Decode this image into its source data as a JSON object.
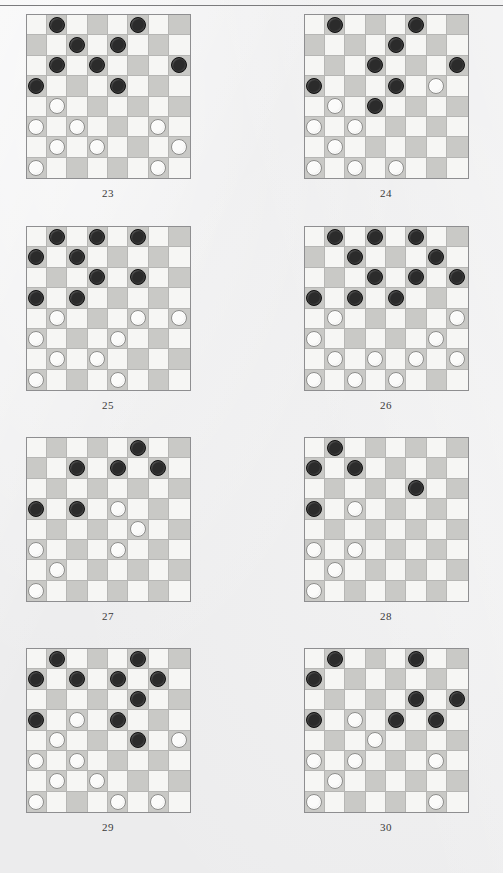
{
  "page": {
    "background_color": "#ececed",
    "rule_color": "#7b7b7d",
    "board_light_color": "#f6f6f4",
    "board_dark_color": "#c9c9c6",
    "board_border_color": "#8e8e90",
    "black_piece_color": "#2b2b2b",
    "white_piece_color": "#fbfbfa"
  },
  "diagrams": [
    {
      "caption": "23",
      "column": "left",
      "row": 0,
      "rows": [
        [
          null,
          "b",
          null,
          null,
          null,
          "b",
          null,
          null
        ],
        [
          null,
          null,
          "b",
          null,
          "b",
          null,
          null,
          null
        ],
        [
          null,
          "b",
          null,
          "b",
          null,
          null,
          null,
          "b"
        ],
        [
          "b",
          null,
          null,
          null,
          "b",
          null,
          null,
          null
        ],
        [
          null,
          "w",
          null,
          null,
          null,
          null,
          null,
          null
        ],
        [
          "w",
          null,
          "w",
          null,
          null,
          null,
          "w",
          null
        ],
        [
          null,
          "w",
          null,
          "w",
          null,
          null,
          null,
          "w"
        ],
        [
          "w",
          null,
          null,
          null,
          null,
          null,
          "w",
          null
        ]
      ]
    },
    {
      "caption": "24",
      "column": "right",
      "row": 0,
      "rows": [
        [
          null,
          "b",
          null,
          null,
          null,
          "b",
          null,
          null
        ],
        [
          null,
          null,
          null,
          null,
          "b",
          null,
          null,
          null
        ],
        [
          null,
          null,
          null,
          "b",
          null,
          null,
          null,
          "b"
        ],
        [
          "b",
          null,
          null,
          null,
          "b",
          null,
          "w",
          null
        ],
        [
          null,
          "w",
          null,
          "b",
          null,
          null,
          null,
          null
        ],
        [
          "w",
          null,
          "w",
          null,
          null,
          null,
          null,
          null
        ],
        [
          null,
          "w",
          null,
          null,
          null,
          null,
          null,
          null
        ],
        [
          "w",
          null,
          "w",
          null,
          "w",
          null,
          null,
          null
        ]
      ]
    },
    {
      "caption": "25",
      "column": "left",
      "row": 1,
      "rows": [
        [
          null,
          "b",
          null,
          "b",
          null,
          "b",
          null,
          null
        ],
        [
          "b",
          null,
          "b",
          null,
          null,
          null,
          null,
          null
        ],
        [
          null,
          null,
          null,
          "b",
          null,
          "b",
          null,
          null
        ],
        [
          "b",
          null,
          "b",
          null,
          null,
          null,
          null,
          null
        ],
        [
          null,
          "w",
          null,
          null,
          null,
          "w",
          null,
          "w"
        ],
        [
          "w",
          null,
          null,
          null,
          "w",
          null,
          null,
          null
        ],
        [
          null,
          "w",
          null,
          "w",
          null,
          null,
          null,
          null
        ],
        [
          "w",
          null,
          null,
          null,
          "w",
          null,
          null,
          null
        ]
      ]
    },
    {
      "caption": "26",
      "column": "right",
      "row": 1,
      "rows": [
        [
          null,
          "b",
          null,
          "b",
          null,
          "b",
          null,
          null
        ],
        [
          null,
          null,
          "b",
          null,
          null,
          null,
          "b",
          null
        ],
        [
          null,
          null,
          null,
          "b",
          null,
          "b",
          null,
          "b"
        ],
        [
          "b",
          null,
          "b",
          null,
          "b",
          null,
          null,
          null
        ],
        [
          null,
          "w",
          null,
          null,
          null,
          null,
          null,
          "w"
        ],
        [
          "w",
          null,
          null,
          null,
          null,
          null,
          "w",
          null
        ],
        [
          null,
          "w",
          null,
          "w",
          null,
          "w",
          null,
          "w"
        ],
        [
          "w",
          null,
          "w",
          null,
          "w",
          null,
          null,
          null
        ]
      ]
    },
    {
      "caption": "27",
      "column": "left",
      "row": 2,
      "rows": [
        [
          null,
          null,
          null,
          null,
          null,
          "b",
          null,
          null
        ],
        [
          null,
          null,
          "b",
          null,
          "b",
          null,
          "b",
          null
        ],
        [
          null,
          null,
          null,
          null,
          null,
          null,
          null,
          null
        ],
        [
          "b",
          null,
          "b",
          null,
          "w",
          null,
          null,
          null
        ],
        [
          null,
          null,
          null,
          null,
          null,
          "w",
          null,
          null
        ],
        [
          "w",
          null,
          null,
          null,
          "w",
          null,
          null,
          null
        ],
        [
          null,
          "w",
          null,
          null,
          null,
          null,
          null,
          null
        ],
        [
          "w",
          null,
          null,
          null,
          null,
          null,
          null,
          null
        ]
      ]
    },
    {
      "caption": "28",
      "column": "right",
      "row": 2,
      "rows": [
        [
          null,
          "b",
          null,
          null,
          null,
          null,
          null,
          null
        ],
        [
          "b",
          null,
          "b",
          null,
          null,
          null,
          null,
          null
        ],
        [
          null,
          null,
          null,
          null,
          null,
          "b",
          null,
          null
        ],
        [
          "b",
          null,
          "w",
          null,
          null,
          null,
          null,
          null
        ],
        [
          null,
          null,
          null,
          null,
          null,
          null,
          null,
          null
        ],
        [
          "w",
          null,
          "w",
          null,
          null,
          null,
          null,
          null
        ],
        [
          null,
          "w",
          null,
          null,
          null,
          null,
          null,
          null
        ],
        [
          "w",
          null,
          null,
          null,
          null,
          null,
          null,
          null
        ]
      ]
    },
    {
      "caption": "29",
      "column": "left",
      "row": 3,
      "rows": [
        [
          null,
          "b",
          null,
          null,
          null,
          "b",
          null,
          null
        ],
        [
          "b",
          null,
          "b",
          null,
          "b",
          null,
          "b",
          null
        ],
        [
          null,
          null,
          null,
          null,
          null,
          "b",
          null,
          null
        ],
        [
          "b",
          null,
          "w",
          null,
          "b",
          null,
          null,
          null
        ],
        [
          null,
          "w",
          null,
          null,
          null,
          "b",
          null,
          "w"
        ],
        [
          "w",
          null,
          "w",
          null,
          null,
          null,
          null,
          null
        ],
        [
          null,
          "w",
          null,
          "w",
          null,
          null,
          null,
          null
        ],
        [
          "w",
          null,
          null,
          null,
          "w",
          null,
          "w",
          null
        ]
      ]
    },
    {
      "caption": "30",
      "column": "right",
      "row": 3,
      "rows": [
        [
          null,
          "b",
          null,
          null,
          null,
          "b",
          null,
          null
        ],
        [
          "b",
          null,
          null,
          null,
          null,
          null,
          null,
          null
        ],
        [
          null,
          null,
          null,
          null,
          null,
          "b",
          null,
          "b"
        ],
        [
          "b",
          null,
          "w",
          null,
          "b",
          null,
          "b",
          null
        ],
        [
          null,
          null,
          null,
          "w",
          null,
          null,
          null,
          null
        ],
        [
          "w",
          null,
          "w",
          null,
          null,
          null,
          "w",
          null
        ],
        [
          null,
          "w",
          null,
          null,
          null,
          null,
          null,
          null
        ],
        [
          "w",
          null,
          null,
          null,
          null,
          null,
          "w",
          null
        ]
      ]
    }
  ]
}
